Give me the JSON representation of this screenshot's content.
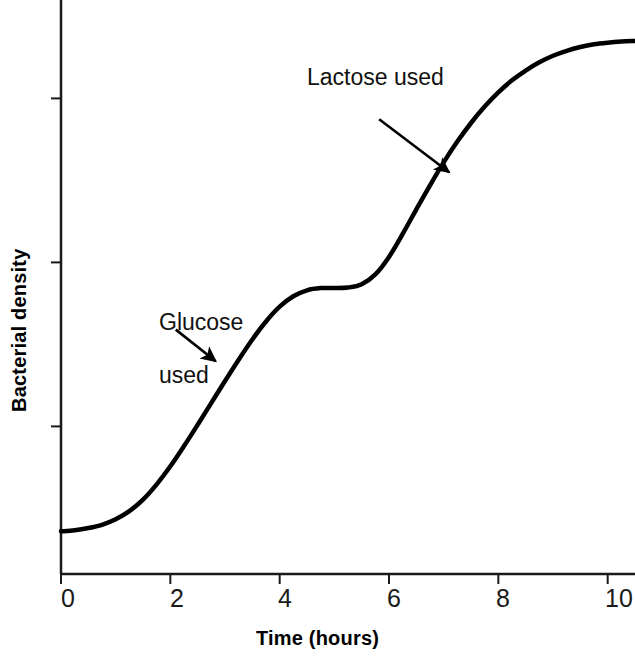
{
  "chart_data": {
    "type": "line",
    "title": "",
    "subtitle": "",
    "xlabel": "Time (hours)",
    "ylabel": "Bacterial density",
    "xlim": [
      0,
      10.5
    ],
    "ylim": [
      0,
      1.05
    ],
    "x_ticks": [
      0,
      2,
      4,
      6,
      8,
      10
    ],
    "x_tick_labels": [
      "0",
      "2",
      "4",
      "6",
      "8",
      "10"
    ],
    "y_ticks": [
      0.27,
      0.57,
      0.87
    ],
    "y_tick_labels": [
      "",
      "",
      ""
    ],
    "grid": false,
    "legend": "none",
    "line_color": "#000000",
    "line_width": 4,
    "series": [
      {
        "name": "Bacterial density (diauxic growth)",
        "x": [
          0.0,
          0.25,
          0.5,
          0.75,
          1.0,
          1.25,
          1.5,
          1.75,
          2.0,
          2.25,
          2.5,
          2.75,
          3.0,
          3.25,
          3.5,
          3.75,
          4.0,
          4.25,
          4.5,
          4.75,
          5.0,
          5.25,
          5.5,
          5.75,
          6.0,
          6.25,
          6.5,
          6.75,
          7.0,
          7.25,
          7.5,
          7.75,
          8.0,
          8.25,
          8.5,
          8.75,
          9.0,
          9.25,
          9.5,
          9.75,
          10.0,
          10.25,
          10.5
        ],
        "y": [
          0.078,
          0.08,
          0.084,
          0.09,
          0.1,
          0.115,
          0.136,
          0.164,
          0.197,
          0.234,
          0.273,
          0.313,
          0.353,
          0.392,
          0.429,
          0.462,
          0.489,
          0.508,
          0.519,
          0.523,
          0.523,
          0.524,
          0.53,
          0.548,
          0.58,
          0.622,
          0.667,
          0.711,
          0.753,
          0.791,
          0.825,
          0.855,
          0.881,
          0.903,
          0.921,
          0.936,
          0.948,
          0.957,
          0.964,
          0.969,
          0.972,
          0.974,
          0.975
        ]
      }
    ],
    "annotations": [
      {
        "id": "glucose",
        "text": "Glucose\nused",
        "text_x": 1.85,
        "text_y": 0.52,
        "arrow_from": [
          2.1,
          0.447
        ],
        "arrow_to": [
          2.83,
          0.389
        ]
      },
      {
        "id": "lactose",
        "text": "Lactose used",
        "text_x": 4.6,
        "text_y": 0.905,
        "arrow_from": [
          5.82,
          0.832
        ],
        "arrow_to": [
          7.1,
          0.735
        ]
      }
    ]
  },
  "axes": {
    "axis_color": "#1a1a1a",
    "axis_width": 2,
    "tick_length": 10
  },
  "tick_labels_x": [
    "0",
    "2",
    "4",
    "6",
    "8",
    "10"
  ],
  "labels": {
    "x_title": "Time (hours)",
    "y_title": "Bacterial density"
  },
  "annotation_text": {
    "glucose_line1": "Glucose",
    "glucose_line2": "used",
    "lactose": "Lactose used"
  }
}
